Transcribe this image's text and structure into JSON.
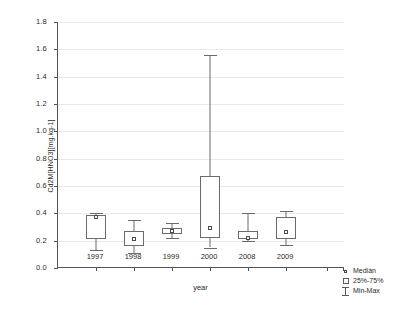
{
  "chart_data": {
    "type": "box",
    "title": "",
    "xlabel": "year",
    "ylabel": "Cd2M[HNO3][mg.kg-1]",
    "categories": [
      "1997",
      "1998",
      "1999",
      "2000",
      "2008",
      "2009"
    ],
    "ylim": [
      0.0,
      1.8
    ],
    "ytick_labels": [
      "0.0",
      "0.2",
      "0.4",
      "0.6",
      "0.8",
      "1.0",
      "1.2",
      "1.4",
      "1.6",
      "1.8"
    ],
    "ytick_values": [
      0.0,
      0.2,
      0.4,
      0.6,
      0.8,
      1.0,
      1.2,
      1.4,
      1.6,
      1.8
    ],
    "grid": true,
    "legend_position": "bottom-right",
    "boxes": [
      {
        "category": "1997",
        "min": 0.13,
        "q1": 0.21,
        "median": 0.375,
        "q3": 0.39,
        "max": 0.4
      },
      {
        "category": "1998",
        "min": 0.11,
        "q1": 0.16,
        "median": 0.21,
        "q3": 0.27,
        "max": 0.35
      },
      {
        "category": "1999",
        "min": 0.22,
        "q1": 0.25,
        "median": 0.27,
        "q3": 0.29,
        "max": 0.33
      },
      {
        "category": "2000",
        "min": 0.15,
        "q1": 0.22,
        "median": 0.29,
        "q3": 0.67,
        "max": 1.56
      },
      {
        "category": "2008",
        "min": 0.2,
        "q1": 0.21,
        "median": 0.22,
        "q3": 0.27,
        "max": 0.4
      },
      {
        "category": "2009",
        "min": 0.17,
        "q1": 0.21,
        "median": 0.26,
        "q3": 0.37,
        "max": 0.42
      }
    ],
    "legend": [
      {
        "symbol": "median-point",
        "label": "Medián"
      },
      {
        "symbol": "box-range",
        "label": "25%-75%"
      },
      {
        "symbol": "whisker",
        "label": "Min-Max"
      }
    ]
  }
}
